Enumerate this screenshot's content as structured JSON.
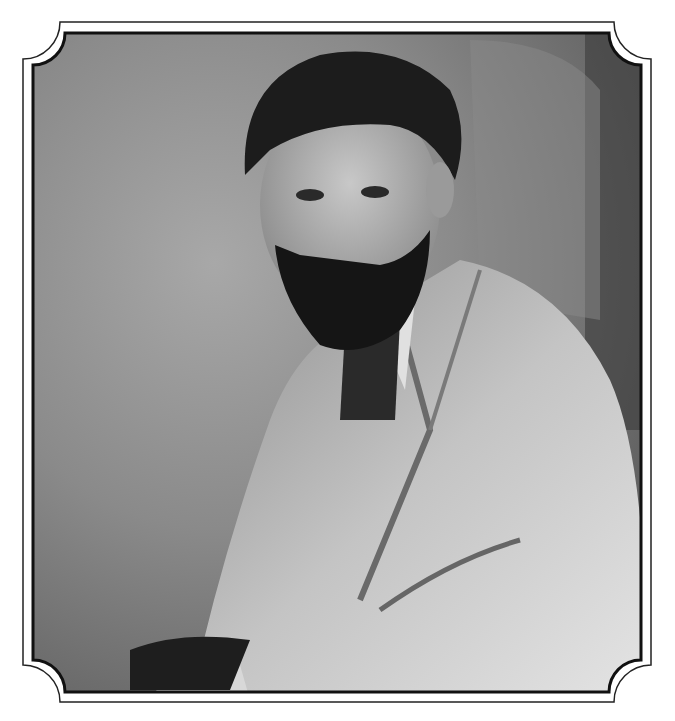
{
  "image": {
    "kind": "portrait-photograph",
    "style": "black-and-white",
    "subject": "bearded man in tweed jacket, seated, looking toward viewer",
    "frame": "scalloped-corner double-line border",
    "colors": {
      "background": "#ffffff",
      "frame_line": "#1a1a1a",
      "backdrop_light": "#9a9a9a",
      "backdrop_dark": "#5a5a5a",
      "hair": "#1e1e1e",
      "skin": "#b8b8b8",
      "beard": "#151515",
      "jacket_light": "#cfcfcf",
      "jacket_mid": "#9c9c9c"
    }
  }
}
